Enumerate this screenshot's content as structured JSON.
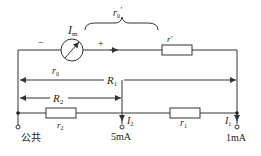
{
  "diagram": {
    "type": "circuit-schematic",
    "colors": {
      "line": "#333333",
      "background": "#ffffff"
    },
    "meter": {
      "label": "I",
      "label_sub": "m",
      "minus_sign": "−",
      "plus_sign": "+"
    },
    "labels": {
      "r0_prime": "r",
      "r0_prime_sub": "0",
      "r0_prime_mark": "'",
      "r_prime": "r'",
      "r0": "r",
      "r0_sub": "0",
      "R1": "R",
      "R1_sub": "1",
      "R2": "R",
      "R2_sub": "2",
      "r2": "r",
      "r2_sub": "2",
      "r1": "r",
      "r1_sub": "1",
      "I2": "I",
      "I2_sub": "2",
      "I1": "I",
      "I1_sub": "1"
    },
    "terminals": [
      {
        "id": "common",
        "label": "公共"
      },
      {
        "id": "5mA",
        "label": "5mA"
      },
      {
        "id": "1mA",
        "label": "1mA"
      }
    ]
  }
}
